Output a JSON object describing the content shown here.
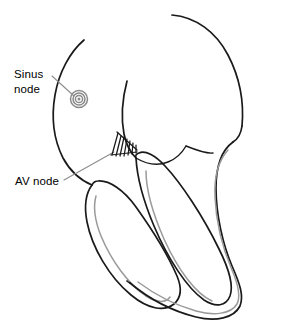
{
  "figure": {
    "background_color": "#ffffff",
    "width": 288,
    "height": 330
  },
  "labels": [
    {
      "id": "sinus-node",
      "text": "Sinus\nnode",
      "lines": [
        "Sinus",
        "node"
      ],
      "x": 14,
      "y": 67,
      "color": "#000000"
    },
    {
      "id": "av-node",
      "text": "AV node",
      "lines": [
        "AV node"
      ],
      "x": 15,
      "y": 174,
      "color": "#000000"
    }
  ],
  "markers": [
    {
      "id": "sinus-node-spiral",
      "name": "sinus-node-spiral-icon",
      "shape": "spiral",
      "center_x": 79,
      "center_y": 99,
      "radius": 9,
      "color": "#8a8a8a"
    },
    {
      "id": "av-node-hatch",
      "name": "av-node-hatch-icon",
      "shape": "hatched-wedge",
      "center_x": 123,
      "center_y": 146,
      "color": "#1a1a1a"
    }
  ],
  "leaders": [
    {
      "id": "sinus-leader",
      "from_x": 52,
      "from_y": 76,
      "to_x": 74,
      "to_y": 96,
      "color": "#8d8d8d"
    },
    {
      "id": "av-leader",
      "from_x": 64,
      "from_y": 180,
      "to_x": 114,
      "to_y": 152,
      "color": "#8d8d8d"
    }
  ],
  "colors": {
    "outline": "#1a1a1a",
    "inner_wall": "#9a9a9a",
    "leader": "#8d8d8d",
    "marker": "#8a8a8a",
    "background": "#ffffff"
  },
  "anatomy_parts": [
    {
      "id": "left-atrium-arc",
      "name": "left-atrium-outline"
    },
    {
      "id": "right-atrium-arc",
      "name": "right-atrium-outline"
    },
    {
      "id": "septum-upper",
      "name": "interventricular-septum-upper"
    },
    {
      "id": "left-ventricle-loop",
      "name": "left-ventricle-outline"
    },
    {
      "id": "right-ventricle-loop",
      "name": "right-ventricle-outline"
    },
    {
      "id": "outer-wall-loop",
      "name": "ventricular-outer-wall"
    },
    {
      "id": "inner-wall-lines",
      "name": "ventricular-endocardium-lines"
    }
  ]
}
